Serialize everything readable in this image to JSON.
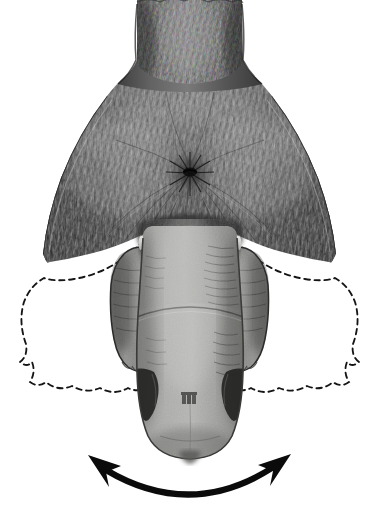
{
  "figure": {
    "kind": "scientific-anatomical-illustration",
    "medium": "grayscale stipple and line engraving",
    "view": "posterior / caudal view",
    "background_color": "#ffffff",
    "width_px": 379,
    "height_px": 515,
    "caption": "Posterior view of the hindquarters showing the pendulous median appendage flanked by the hind limbs, the lateral membranous flaps (solid = resting position, dashed = displaced position), and the arc of lateral swing.",
    "has_text_labels": false,
    "label_text": ""
  },
  "palette": {
    "background": "#ffffff",
    "fur_dark": "#3a3a3a",
    "fur_mid": "#5e5e5e",
    "fur_light": "#8f8f8f",
    "fur_highlight": "#b9b9b9",
    "skin_gray": "#a0a09e",
    "skin_gray_light": "#b4b4b2",
    "skin_gray_dark": "#8a8a88",
    "marking_black": "#2a2a2a",
    "membrane_white": "#ffffff",
    "outline_black": "#111111",
    "arrow_black": "#0b0b0b",
    "dash_black": "#151515"
  },
  "parts": [
    {
      "id": "neck",
      "name": "Neck / nape",
      "texture": "dense short fur, hairs directed caudally",
      "tone": "#4a4a4a"
    },
    {
      "id": "torso",
      "name": "Dorsal torso / rump",
      "texture": "radiating fur with central whorl",
      "tone": "#555555"
    },
    {
      "id": "hair-whorl",
      "name": "Hair whorl (rosette)",
      "texture": "hairs radiating from a central point",
      "tone": "#2d2d2d"
    },
    {
      "id": "collar-band",
      "name": "Pale collar band at base of appendage",
      "texture": "smooth highlight band",
      "tone": "#d8d8d6"
    },
    {
      "id": "median-appendage",
      "name": "Median pendulous appendage",
      "texture": "hairless wrinkled skin with fine transverse creases",
      "tone": "#a0a09e"
    },
    {
      "id": "hind-limb-left",
      "name": "Left hind limb",
      "texture": "short-furred with digit pads at the tip",
      "tone": "#8e8e8c"
    },
    {
      "id": "hind-limb-right",
      "name": "Right hind limb",
      "texture": "short-furred with digit pads at the tip",
      "tone": "#8e8e8c"
    },
    {
      "id": "membrane-left",
      "name": "Left lateral membranous flap",
      "texture": "unshaded white field",
      "tone": "#ffffff"
    },
    {
      "id": "membrane-right",
      "name": "Right lateral membranous flap",
      "texture": "unshaded white field",
      "tone": "#ffffff"
    },
    {
      "id": "dashed-outline-left",
      "name": "Left dashed displacement outline",
      "texture": "short-dash contour",
      "tone": "#151515"
    },
    {
      "id": "dashed-outline-right",
      "name": "Right dashed displacement outline",
      "texture": "short-dash contour",
      "tone": "#151515"
    },
    {
      "id": "marking-left",
      "name": "Left dark flank marking",
      "texture": "solid dark patch",
      "tone": "#2a2a2a"
    },
    {
      "id": "marking-right",
      "name": "Right dark flank marking",
      "texture": "solid dark patch",
      "tone": "#2a2a2a"
    },
    {
      "id": "marking-median",
      "name": "Small median dark spot",
      "texture": "small stippled patch",
      "tone": "#4b4b4b"
    },
    {
      "id": "motion-arrow",
      "name": "Double-headed curved motion arrow",
      "texture": "solid black arc with two arrowheads",
      "tone": "#0b0b0b"
    }
  ],
  "annotations": {
    "motion_arrow": {
      "name": "lateral swing arrow",
      "style": "double-headed curved arc",
      "meaning": "range of side-to-side (lateral) movement",
      "direction": "bidirectional left and right",
      "color": "#0b0b0b"
    },
    "dashed_outline": {
      "name": "displaced-position outline",
      "style": "short dashed contour",
      "meaning": "alternate / extended position of the lateral membranes",
      "color": "#151515"
    }
  }
}
